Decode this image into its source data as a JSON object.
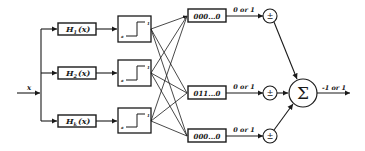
{
  "diagram": {
    "input": {
      "label": "x"
    },
    "filters": [
      {
        "label": "H",
        "sub": "1",
        "arg": "(x)"
      },
      {
        "label": "H",
        "sub": "2",
        "arg": "(x)"
      },
      {
        "label": "H",
        "sub": "k",
        "arg": "(x)"
      }
    ],
    "thresholds": [
      {
        "high": "1",
        "low": "a"
      },
      {
        "high": "1",
        "low": "a"
      },
      {
        "high": "1",
        "low": "a"
      }
    ],
    "codes": [
      {
        "value": "000...0",
        "edge_label": "0 or 1",
        "sign": "±"
      },
      {
        "value": "011...0",
        "edge_label": "0 or 1",
        "sign": "±"
      },
      {
        "value": "000...0",
        "edge_label": "0 or 1",
        "sign": "±"
      }
    ],
    "sum": {
      "symbol": "Σ",
      "output_label": "-1 or 1"
    },
    "colors": {
      "stroke": "#1a1a1a",
      "background": "#ffffff"
    }
  }
}
